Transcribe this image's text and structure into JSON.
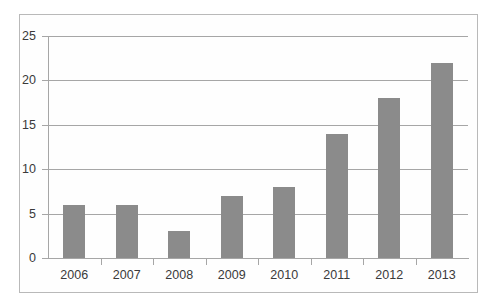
{
  "chart_data": {
    "type": "bar",
    "title": "",
    "subtitle": "",
    "xlabel": "",
    "ylabel": "",
    "categories": [
      "2006",
      "2007",
      "2008",
      "2009",
      "2010",
      "2011",
      "2012",
      "2013"
    ],
    "values": [
      6,
      6,
      3,
      7,
      8,
      14,
      18,
      22
    ],
    "ylim": [
      0,
      25
    ],
    "ytick_values": [
      0,
      5,
      10,
      15,
      20,
      25
    ],
    "ytick_labels": [
      "0",
      "5",
      "10",
      "15",
      "20",
      "25"
    ],
    "grid": true,
    "grid_axis": "y",
    "legend": false,
    "legend_position": "none",
    "bar_color": "#8b8b8b",
    "gridline_color": "#a6a6a6",
    "axis_color": "#a6a6a6",
    "border_color": "#b9b9b9",
    "background_color": "#ffffff",
    "text_color": "#3a3a3a"
  }
}
